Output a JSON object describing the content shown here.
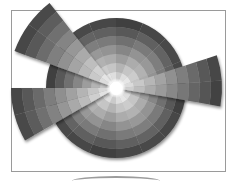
{
  "diagram": {
    "type": "polar-area-segmented",
    "frame": {
      "x": 11,
      "y": 10,
      "width": 215,
      "height": 162,
      "border_color": "#9a9a9a"
    },
    "center": {
      "x": 116,
      "y": 88
    },
    "hub_radius": 7,
    "hub_color": "#ffffff",
    "base_radius": 70,
    "rings": 7,
    "sectors": 16,
    "palette": {
      "inner": "#e6e6e6",
      "outer": "#4a4a4a",
      "edge_dark": "#2f2f2f"
    },
    "extruded_wedges": [
      {
        "name": "upper-left-wedge",
        "start_deg": 200,
        "end_deg": 232,
        "radius": 108
      },
      {
        "name": "right-wedge",
        "start_deg": -18,
        "end_deg": 10,
        "radius": 106
      },
      {
        "name": "lower-left-wedge",
        "start_deg": 150,
        "end_deg": 180,
        "radius": 105
      }
    ]
  }
}
